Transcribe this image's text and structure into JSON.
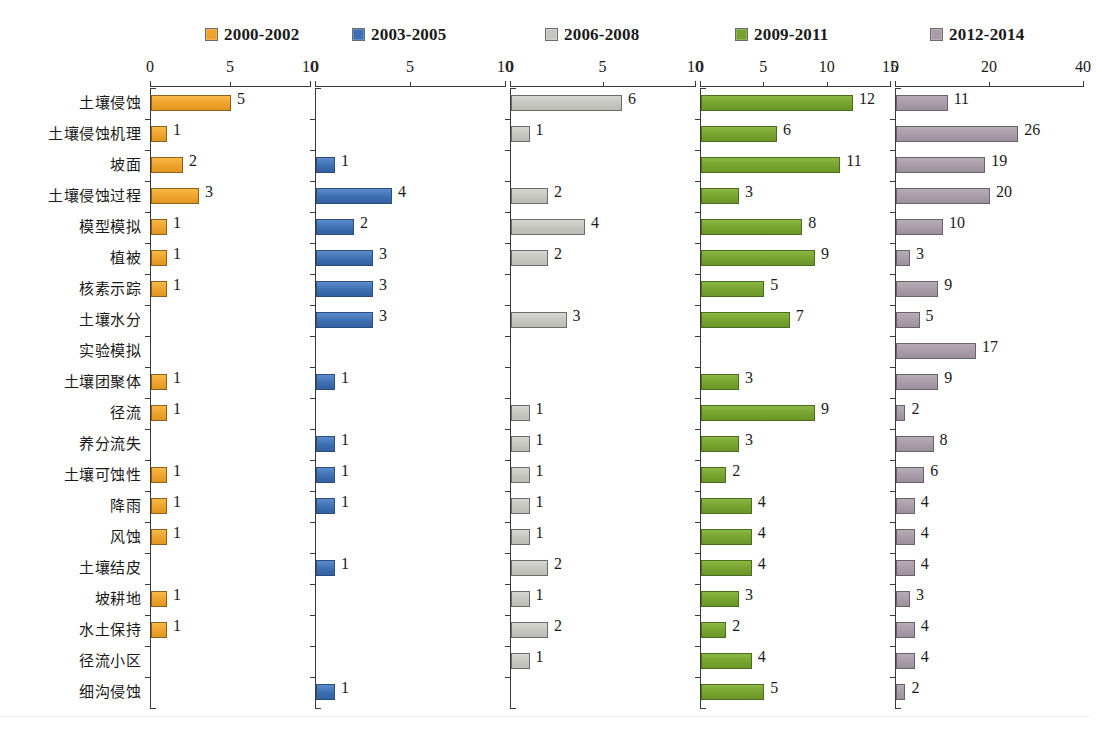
{
  "chart_data": {
    "type": "bar",
    "title": "",
    "subtitle": "",
    "xlabel": "",
    "ylabel": "",
    "orientation": "horizontal",
    "layout": "5 side-by-side panels sharing one category axis",
    "grid": false,
    "legend_position": "top",
    "categories": [
      "土壤侵蚀",
      "土壤侵蚀机理",
      "坡面",
      "土壤侵蚀过程",
      "模型模拟",
      "植被",
      "核素示踪",
      "土壤水分",
      "实验模拟",
      "土壤团聚体",
      "径流",
      "养分流失",
      "土壤可蚀性",
      "降雨",
      "风蚀",
      "土壤结皮",
      "坡耕地",
      "水土保持",
      "径流小区",
      "细沟侵蚀"
    ],
    "series": [
      {
        "name": "2000-2002",
        "color": "#efa22c",
        "swatch_class": "orange",
        "xlim": [
          0,
          10
        ],
        "xticks": [
          0,
          5,
          10
        ],
        "values": [
          5,
          1,
          2,
          3,
          1,
          1,
          1,
          null,
          null,
          1,
          1,
          null,
          1,
          1,
          1,
          null,
          1,
          1,
          null,
          null
        ]
      },
      {
        "name": "2003-2005",
        "color": "#3d6fb4",
        "swatch_class": "blue",
        "xlim": [
          0,
          10
        ],
        "xticks": [
          0,
          5,
          10
        ],
        "values": [
          null,
          null,
          1,
          4,
          2,
          3,
          3,
          3,
          null,
          1,
          null,
          1,
          1,
          1,
          null,
          1,
          null,
          null,
          null,
          1
        ]
      },
      {
        "name": "2006-2008",
        "color": "#c6c6c1",
        "swatch_class": "grey",
        "xlim": [
          0,
          10
        ],
        "xticks": [
          0,
          5,
          10
        ],
        "values": [
          6,
          1,
          null,
          2,
          4,
          2,
          null,
          3,
          null,
          null,
          1,
          1,
          1,
          1,
          1,
          2,
          1,
          2,
          1,
          null
        ]
      },
      {
        "name": "2009-2011",
        "color": "#76a32e",
        "swatch_class": "green",
        "xlim": [
          0,
          15
        ],
        "xticks": [
          0,
          5,
          10,
          15
        ],
        "values": [
          12,
          6,
          11,
          3,
          8,
          9,
          5,
          7,
          null,
          3,
          9,
          3,
          2,
          4,
          4,
          4,
          3,
          2,
          4,
          5
        ]
      },
      {
        "name": "2012-2014",
        "color": "#a89ca8",
        "swatch_class": "mauve",
        "xlim": [
          0,
          40
        ],
        "xticks": [
          0,
          20,
          40
        ],
        "values": [
          11,
          26,
          19,
          20,
          10,
          3,
          9,
          5,
          17,
          9,
          2,
          8,
          6,
          4,
          4,
          4,
          3,
          4,
          4,
          2
        ]
      }
    ]
  }
}
